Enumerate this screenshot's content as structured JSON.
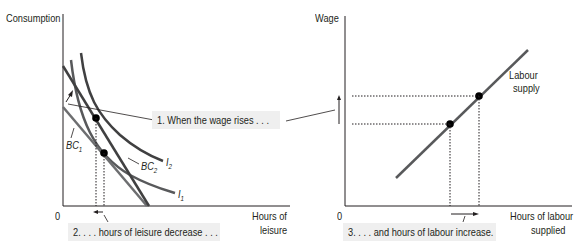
{
  "left_panel": {
    "y_axis_label": "Consumption",
    "x_axis_label_line1": "Hours of",
    "x_axis_label_line2": "leisure",
    "origin_label": "0",
    "curve_labels": {
      "bc1": "BC",
      "bc1_sub": "1",
      "bc2": "BC",
      "bc2_sub": "2",
      "i1": "I",
      "i1_sub": "1",
      "i2": "I",
      "i2_sub": "2"
    },
    "annotation_1": "1. When the wage rises . . .",
    "annotation_2": "2. . . . hours of leisure decrease . . ."
  },
  "right_panel": {
    "y_axis_label": "Wage",
    "x_axis_label_line1": "Hours of labour",
    "x_axis_label_line2": "supplied",
    "origin_label": "0",
    "curve_label_line1": "Labour",
    "curve_label_line2": "supply",
    "annotation_3": "3. . . . and hours of labour increase."
  },
  "colors": {
    "axis": "#231f20",
    "curve": "#58595b",
    "budget_dark": "#404041",
    "annotation_bg": "#efefef"
  }
}
